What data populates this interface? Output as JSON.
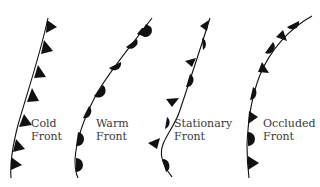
{
  "colors": {
    "ink": "#111111",
    "label": "#3a3a3a",
    "background": "#ffffff"
  },
  "fronts": [
    {
      "id": "cold",
      "label_line1": "Cold",
      "label_line2": "Front",
      "symbol": "triangles",
      "symbol_side": "right",
      "symbol_count": 7
    },
    {
      "id": "warm",
      "label_line1": "Warm",
      "label_line2": "Front",
      "symbol": "semicircles",
      "symbol_side": "right",
      "symbol_count": 7
    },
    {
      "id": "stationary",
      "label_line1": "Stationary",
      "label_line2": "Front",
      "symbol": "alternating triangles (left) and semicircles (right)",
      "symbol_count": 7
    },
    {
      "id": "occluded",
      "label_line1": "Occluded",
      "label_line2": "Front",
      "symbol": "alternating semicircles and triangles (right)",
      "symbol_side": "right",
      "symbol_count": 8
    }
  ]
}
